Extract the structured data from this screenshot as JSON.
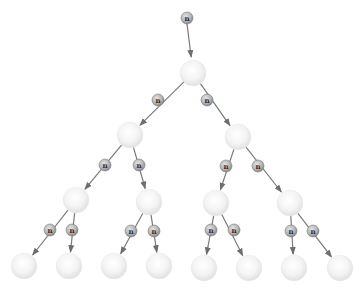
{
  "diagram": {
    "type": "binary-tree",
    "edge_label": "n",
    "colors": {
      "node_fill_center": "#ffffff",
      "node_fill_edge": "#e2e2e2",
      "edge": "#7a7a7a",
      "label_fill_center": "#d8d8d8",
      "label_fill_edge": "#8c8c8c",
      "label_text": "#2a2a2a"
    },
    "node_radius": 13,
    "label_radius": 6,
    "input": {
      "label": "n",
      "x": 187,
      "y": 18
    },
    "nodes": [
      {
        "id": "root",
        "x": 193,
        "y": 73,
        "level": 0
      },
      {
        "id": "L",
        "x": 130,
        "y": 135,
        "level": 1
      },
      {
        "id": "R",
        "x": 238,
        "y": 137,
        "level": 1
      },
      {
        "id": "LL",
        "x": 76,
        "y": 200,
        "level": 2
      },
      {
        "id": "LR",
        "x": 149,
        "y": 202,
        "level": 2
      },
      {
        "id": "RL",
        "x": 216,
        "y": 203,
        "level": 2
      },
      {
        "id": "RR",
        "x": 290,
        "y": 203,
        "level": 2
      },
      {
        "id": "LLL",
        "x": 24,
        "y": 266,
        "level": 3
      },
      {
        "id": "LLR",
        "x": 69,
        "y": 266,
        "level": 3
      },
      {
        "id": "LRL",
        "x": 114,
        "y": 266,
        "level": 3
      },
      {
        "id": "LRR",
        "x": 159,
        "y": 266,
        "level": 3
      },
      {
        "id": "RLL",
        "x": 204,
        "y": 268,
        "level": 3
      },
      {
        "id": "RLR",
        "x": 249,
        "y": 268,
        "level": 3
      },
      {
        "id": "RRL",
        "x": 294,
        "y": 268,
        "level": 3
      },
      {
        "id": "RRR",
        "x": 340,
        "y": 268,
        "level": 3
      }
    ],
    "edges": [
      {
        "from": "root",
        "to": "L",
        "label": "n",
        "lx": 158,
        "ly": 100
      },
      {
        "from": "root",
        "to": "R",
        "label": "n",
        "lx": 207,
        "ly": 100
      },
      {
        "from": "L",
        "to": "LL",
        "label": "n",
        "lx": 105,
        "ly": 165
      },
      {
        "from": "L",
        "to": "LR",
        "label": "n",
        "lx": 139,
        "ly": 165
      },
      {
        "from": "R",
        "to": "RL",
        "label": "n",
        "lx": 226,
        "ly": 166
      },
      {
        "from": "R",
        "to": "RR",
        "label": "n",
        "lx": 258,
        "ly": 166
      },
      {
        "from": "LL",
        "to": "LLL",
        "label": "n",
        "lx": 50,
        "ly": 230
      },
      {
        "from": "LL",
        "to": "LLR",
        "label": "n",
        "lx": 72,
        "ly": 230
      },
      {
        "from": "LR",
        "to": "LRL",
        "label": "n",
        "lx": 131,
        "ly": 231
      },
      {
        "from": "LR",
        "to": "LRR",
        "label": "n",
        "lx": 154,
        "ly": 231
      },
      {
        "from": "RL",
        "to": "RLL",
        "label": "n",
        "lx": 211,
        "ly": 230
      },
      {
        "from": "RL",
        "to": "RLR",
        "label": "n",
        "lx": 234,
        "ly": 230
      },
      {
        "from": "RR",
        "to": "RRL",
        "label": "n",
        "lx": 291,
        "ly": 231
      },
      {
        "from": "RR",
        "to": "RRR",
        "label": "n",
        "lx": 313,
        "ly": 231
      }
    ]
  }
}
